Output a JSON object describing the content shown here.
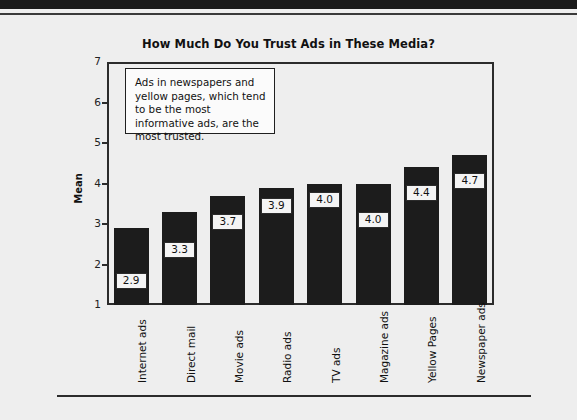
{
  "page": {
    "background_color": "#eeeeee",
    "top_band_color": "#1a1a1a"
  },
  "chart_data": {
    "type": "bar",
    "title": "How Much Do You Trust Ads in These Media?",
    "xlabel": "",
    "ylabel": "Mean",
    "ylim": [
      1,
      7
    ],
    "yticks": [
      1,
      2,
      3,
      4,
      5,
      6,
      7
    ],
    "ytick_labels": [
      "1",
      "2",
      "3",
      "4",
      "5",
      "6",
      "7"
    ],
    "grid": false,
    "legend": null,
    "bar_color": "#1c1c1c",
    "categories": [
      "Internet ads",
      "Direct mail",
      "Movie ads",
      "Radio ads",
      "TV ads",
      "Magazine ads",
      "Yellow Pages",
      "Newspaper ads"
    ],
    "values": [
      2.9,
      3.3,
      3.7,
      3.9,
      4.0,
      4.0,
      4.4,
      4.7
    ],
    "value_labels": [
      "2.9",
      "3.3",
      "3.7",
      "3.9",
      "4.0",
      "4.0",
      "4.4",
      "4.7"
    ],
    "annotations": [
      {
        "name": "callout",
        "text": "Ads in newspapers and yellow pages, which tend to be the most informative ads, are the most trusted."
      }
    ]
  }
}
